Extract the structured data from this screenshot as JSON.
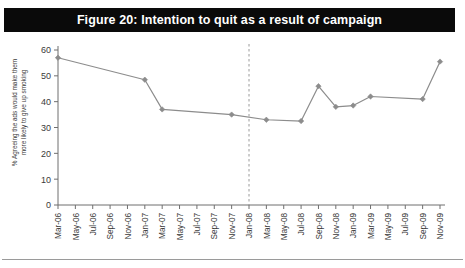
{
  "figure": {
    "title": "Figure 20: Intention to quit as a result of campaign",
    "banner_color": "#0a0a0a",
    "banner_text_color": "#ffffff"
  },
  "axis": {
    "y_title_line1": "% Agreeing the ads would make them",
    "y_title_line2": "more likely to give up smoking",
    "y_ticks": [
      "0",
      "10",
      "20",
      "30",
      "40",
      "50",
      "60"
    ],
    "x_title": ""
  },
  "chart_data": {
    "type": "line",
    "title": "Figure 20: Intention to quit as a result of campaign",
    "xlabel": "",
    "ylabel": "% Agreeing the ads would make them more likely to give up smoking",
    "ylim": [
      0,
      60
    ],
    "ytick_step": 10,
    "grid": false,
    "legend": null,
    "marker": "diamond",
    "line_color": "#8c8c8c",
    "marker_color": "#8c8c8c",
    "categories": [
      "Mar-06",
      "May-06",
      "Jul-06",
      "Sep-06",
      "Nov-06",
      "Jan-07",
      "Mar-07",
      "May-07",
      "Jul-07",
      "Sep-07",
      "Nov-07",
      "Jan-08",
      "Mar-08",
      "May-08",
      "Jul-08",
      "Sep-08",
      "Nov-08",
      "Jan-09",
      "Mar-09",
      "May-09",
      "Jul-09",
      "Sep-09",
      "Nov-09"
    ],
    "series": [
      {
        "name": "Intention to quit",
        "values": [
          57,
          null,
          null,
          null,
          null,
          48.5,
          37,
          null,
          null,
          null,
          35,
          null,
          33,
          null,
          32.5,
          46,
          38,
          38.5,
          42,
          null,
          null,
          41,
          55.5
        ]
      }
    ],
    "annotations": [
      {
        "type": "vertical-dashed-line",
        "at_category": "Jan-08",
        "label": "",
        "color": "#9a9a9a"
      }
    ]
  }
}
